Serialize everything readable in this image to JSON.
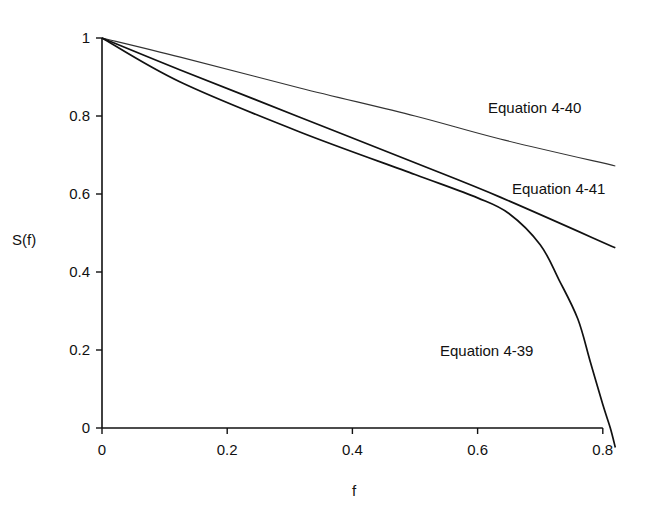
{
  "chart_data": {
    "type": "line",
    "title": "",
    "xlabel": "f",
    "ylabel": "S(f)",
    "xlim": [
      0,
      0.8
    ],
    "ylim": [
      0,
      1
    ],
    "x_ticks": [
      "0",
      "0.2",
      "0.4",
      "0.6",
      "0.8"
    ],
    "y_ticks": [
      "0",
      "0.2",
      "0.4",
      "0.6",
      "0.8",
      "1"
    ],
    "grid": false,
    "legend": "inline labels next to curves",
    "series": [
      {
        "name": "Equation 4-40",
        "style": "thin",
        "x": [
          0,
          0.125,
          0.316,
          0.5,
          0.636,
          0.82
        ],
        "y": [
          1.0,
          0.951,
          0.872,
          0.8,
          0.741,
          0.672
        ]
      },
      {
        "name": "Equation 4-41",
        "style": "solid",
        "x": [
          0,
          0.125,
          0.316,
          0.5,
          0.636,
          0.82
        ],
        "y": [
          1.0,
          0.918,
          0.797,
          0.68,
          0.592,
          0.462
        ]
      },
      {
        "name": "Equation 4-39",
        "style": "solid",
        "x": [
          0,
          0.125,
          0.316,
          0.5,
          0.6,
          0.65,
          0.7,
          0.73,
          0.76,
          0.78,
          0.8,
          0.812,
          0.82
        ],
        "y": [
          1.0,
          0.887,
          0.759,
          0.65,
          0.59,
          0.55,
          0.47,
          0.38,
          0.28,
          0.17,
          0.06,
          0.0,
          -0.05
        ]
      }
    ]
  },
  "labels": {
    "ylabel": "S(f)",
    "xlabel": "f",
    "eq40": "Equation 4-40",
    "eq41": "Equation 4-41",
    "eq39": "Equation 4-39"
  }
}
